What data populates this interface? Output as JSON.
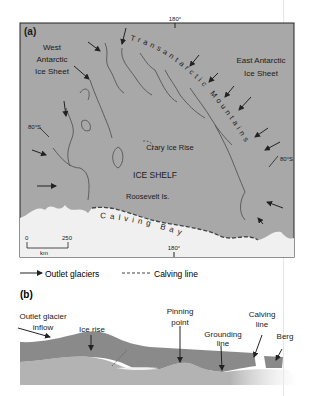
{
  "panel_a": {
    "label": "(a)",
    "title_ws": [
      "West",
      "Antarctic",
      "Ice Sheet"
    ],
    "title_es": [
      "East Antarctic",
      "Ice Sheet"
    ],
    "mountains": "Transantarctic Mountains",
    "crary": "Crary Ice Rise",
    "ice_shelf": "ICE SHELF",
    "roosevelt": "Roosevelt Is.",
    "calving_bay": "Calving Bay",
    "lon_top": "180°",
    "lon_bottom": "180°",
    "lat_left": "80°S",
    "lat_right": "80°S",
    "scale": {
      "zero": "0",
      "max": "250",
      "unit": "km"
    }
  },
  "legend": {
    "outlet": "Outlet glaciers",
    "calving": "Calving line"
  },
  "panel_b": {
    "label": "(b)",
    "inflow": [
      "Outlet glacier",
      "inflow"
    ],
    "ice_rise": "Ice rise",
    "pinning": [
      "Pinning",
      "point"
    ],
    "grounding": [
      "Grounding",
      "line"
    ],
    "calving": [
      "Calving",
      "line"
    ],
    "berg": "Berg"
  },
  "colors": {
    "land": "#a3a3a3",
    "sea": "#f0f0f0",
    "ice_b": "#8a8a8a",
    "bed_b": "#b3b3b3"
  }
}
